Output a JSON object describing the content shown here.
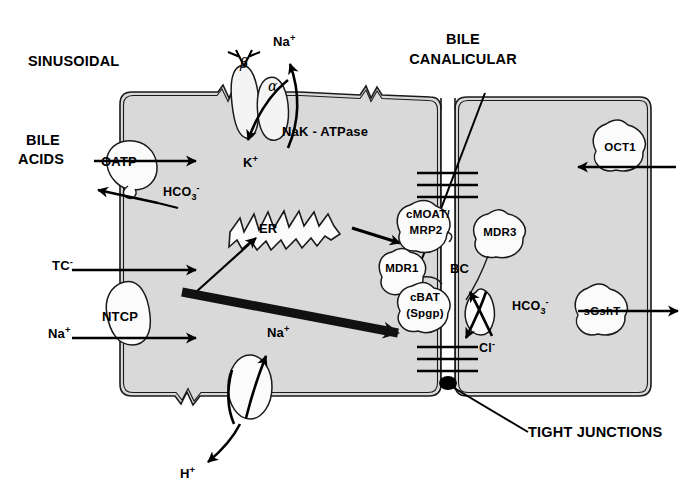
{
  "figure": {
    "title_regions": {
      "sinusoidal": "SINUSOIDAL",
      "bile_canalicular_line1": "BILE",
      "bile_canalicular_line2": "CANALICULAR"
    },
    "colors": {
      "cytoplasm": "#d9d9d9",
      "membrane_stroke": "#1a1a1a",
      "ink": "#000000",
      "background": "#ffffff",
      "thick_arrow": "#111111"
    }
  },
  "labels": {
    "sinusoidal": "SINUSOIDAL",
    "bile_line1": "BILE",
    "bile_line2": "CANALICULAR",
    "bile_acids_line1": "BILE",
    "bile_acids_line2": "ACIDS",
    "hco3_left": "HCO3-",
    "hco3_right": "HCO3-",
    "tc_minus": "TC-",
    "na_ntcp": "Na+",
    "na_top": "Na+",
    "k_top": "K+",
    "na_bottom": "Na+",
    "h_bottom": "H+",
    "cl_minus": "Cl-",
    "nak_atpase": "NaK - ATPase",
    "alpha": "α",
    "beta": "β",
    "er": "ER",
    "bc": "BC",
    "tight_junctions": "TIGHT JUNCTIONS"
  },
  "transporters": [
    {
      "id": "oatp",
      "name": "OATP",
      "x": 128,
      "y": 163,
      "direction": "influx-and-efflux"
    },
    {
      "id": "ntcp",
      "name": "NTCP",
      "x": 124,
      "y": 318,
      "direction": "influx"
    },
    {
      "id": "cmoat",
      "name_line1": "cMOAT/",
      "name_line2": "MRP2",
      "x": 432,
      "y": 224,
      "direction": "efflux-to-canaliculus"
    },
    {
      "id": "mdr1",
      "name": "MDR1",
      "x": 409,
      "y": 270,
      "direction": "efflux-to-canaliculus"
    },
    {
      "id": "mdr3",
      "name": "MDR3",
      "x": 504,
      "y": 232,
      "direction": "efflux-to-canaliculus"
    },
    {
      "id": "cbat",
      "name_line1": "cBAT",
      "name_line2": "(Spgp)",
      "x": 432,
      "y": 305,
      "direction": "efflux-to-canaliculus"
    },
    {
      "id": "sgsht",
      "name": "sGshT",
      "x": 606,
      "y": 311,
      "direction": "efflux"
    },
    {
      "id": "oct1",
      "name": "OCT1",
      "x": 623,
      "y": 148,
      "direction": "influx"
    }
  ],
  "structures": {
    "nak_atpase_subunits": [
      "α",
      "β"
    ],
    "endoplasmic_reticulum": "ER",
    "bile_canaliculus": "BC",
    "tight_junctions": "TIGHT JUNCTIONS",
    "ion_fluxes": [
      {
        "species": "Na+",
        "site": "NaK-ATPase",
        "direction": "out"
      },
      {
        "species": "K+",
        "site": "NaK-ATPase",
        "direction": "in"
      },
      {
        "species": "Na+",
        "site": "Na/H exchanger",
        "direction": "in"
      },
      {
        "species": "H+",
        "site": "Na/H exchanger",
        "direction": "out"
      },
      {
        "species": "HCO3-",
        "site": "OATP",
        "direction": "out"
      },
      {
        "species": "HCO3-",
        "site": "canalicular AE",
        "direction": "in"
      },
      {
        "species": "Cl-",
        "site": "canalicular AE",
        "direction": "out"
      },
      {
        "species": "TC-",
        "site": "NTCP",
        "direction": "in"
      },
      {
        "species": "Na+",
        "site": "NTCP",
        "direction": "in"
      }
    ]
  }
}
